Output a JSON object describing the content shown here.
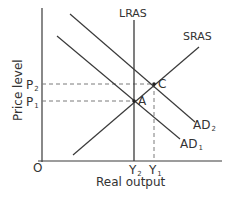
{
  "diagram": {
    "type": "AD-AS model",
    "colors": {
      "line": "#3a3a3a",
      "dash": "#7a7a7a",
      "text": "#333333",
      "background": "#ffffff"
    },
    "axes": {
      "x_label": "Real output",
      "y_label": "Price level",
      "origin_label": "O"
    },
    "curves": {
      "lras": {
        "label": "LRAS"
      },
      "sras": {
        "label": "SRAS"
      },
      "ad1": {
        "label": "AD",
        "sub": "1"
      },
      "ad2": {
        "label": "AD",
        "sub": "2"
      }
    },
    "points": {
      "a": {
        "label": "A"
      },
      "c": {
        "label": "C"
      }
    },
    "price_ticks": {
      "p2": {
        "label": "P",
        "sub": "2"
      },
      "p1": {
        "label": "P",
        "sub": "1"
      }
    },
    "output_ticks": {
      "y2": {
        "label": "Y",
        "sub": "2"
      },
      "y1": {
        "label": "Y",
        "sub": "1"
      }
    }
  }
}
